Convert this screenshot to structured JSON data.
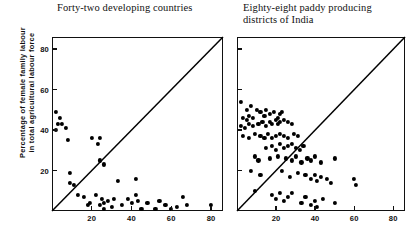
{
  "figure": {
    "ylabel_line1": "Percentage of female family labour",
    "ylabel_line2": "in total agricultural labour force",
    "ink_color": "#000000"
  },
  "chart_data": [
    {
      "type": "scatter",
      "panel": "left",
      "title": "Forty-two developing countries",
      "xlabel": "",
      "ylabel": "Percentage of female family labour in total agricultural labour force",
      "xlim": [
        0,
        86
      ],
      "ylim": [
        0,
        86
      ],
      "xticks": [
        20,
        40,
        60,
        80
      ],
      "yticks": [
        20,
        40,
        60,
        80
      ],
      "grid": false,
      "legend": "none",
      "annotations": [
        "45-degree reference line from origin to top-right corner"
      ],
      "reference_line": {
        "type": "identity",
        "from": [
          0,
          0
        ],
        "to": [
          86,
          86
        ]
      },
      "n_points": 42,
      "points": [
        [
          2,
          49
        ],
        [
          4,
          46
        ],
        [
          3,
          43
        ],
        [
          5,
          43
        ],
        [
          2,
          40
        ],
        [
          7,
          41
        ],
        [
          8,
          35
        ],
        [
          9,
          19
        ],
        [
          9,
          14
        ],
        [
          11,
          13
        ],
        [
          13,
          8
        ],
        [
          16,
          7
        ],
        [
          18,
          3
        ],
        [
          19,
          4
        ],
        [
          20,
          36
        ],
        [
          23,
          33
        ],
        [
          24,
          36
        ],
        [
          24,
          25
        ],
        [
          26,
          23
        ],
        [
          22,
          8
        ],
        [
          24,
          3
        ],
        [
          25,
          6
        ],
        [
          26,
          4
        ],
        [
          26,
          1
        ],
        [
          28,
          5
        ],
        [
          30,
          2
        ],
        [
          31,
          6
        ],
        [
          33,
          15
        ],
        [
          35,
          3
        ],
        [
          38,
          6
        ],
        [
          40,
          4
        ],
        [
          42,
          16
        ],
        [
          42,
          8
        ],
        [
          43,
          5
        ],
        [
          45,
          1
        ],
        [
          48,
          4
        ],
        [
          52,
          1
        ],
        [
          54,
          5
        ],
        [
          57,
          3
        ],
        [
          60,
          1
        ],
        [
          63,
          2
        ],
        [
          66,
          7
        ],
        [
          68,
          3
        ],
        [
          80,
          3
        ]
      ]
    },
    {
      "type": "scatter",
      "panel": "right",
      "title_line1": "Eighty-eight paddy producing",
      "title_line2": "districts of India",
      "title": "Eighty-eight paddy producing districts of India",
      "xlabel": "",
      "ylabel": "Percentage of female family labour in total agricultural labour force",
      "xlim": [
        0,
        86
      ],
      "ylim": [
        0,
        86
      ],
      "xticks": [
        20,
        40,
        60,
        80
      ],
      "yticks": [
        20,
        40,
        60,
        80
      ],
      "grid": false,
      "legend": "none",
      "annotations": [
        "45-degree reference line from origin to top-right corner"
      ],
      "reference_line": {
        "type": "identity",
        "from": [
          0,
          0
        ],
        "to": [
          86,
          86
        ]
      },
      "n_points": 88,
      "points": [
        [
          2,
          54
        ],
        [
          5,
          50
        ],
        [
          7,
          52
        ],
        [
          3,
          46
        ],
        [
          5,
          45
        ],
        [
          6,
          47
        ],
        [
          8,
          46
        ],
        [
          10,
          50
        ],
        [
          12,
          49
        ],
        [
          14,
          47
        ],
        [
          15,
          50
        ],
        [
          17,
          48
        ],
        [
          19,
          49
        ],
        [
          21,
          46
        ],
        [
          22,
          48
        ],
        [
          23,
          49
        ],
        [
          2,
          42
        ],
        [
          4,
          41
        ],
        [
          6,
          43
        ],
        [
          8,
          42
        ],
        [
          11,
          43
        ],
        [
          13,
          44
        ],
        [
          15,
          42
        ],
        [
          17,
          44
        ],
        [
          18,
          43
        ],
        [
          20,
          45
        ],
        [
          21,
          43
        ],
        [
          22,
          44
        ],
        [
          24,
          45
        ],
        [
          26,
          44
        ],
        [
          28,
          43
        ],
        [
          3,
          37
        ],
        [
          6,
          36
        ],
        [
          9,
          38
        ],
        [
          12,
          37
        ],
        [
          14,
          36
        ],
        [
          16,
          38
        ],
        [
          18,
          36
        ],
        [
          20,
          37
        ],
        [
          22,
          38
        ],
        [
          24,
          37
        ],
        [
          26,
          36
        ],
        [
          29,
          38
        ],
        [
          31,
          37
        ],
        [
          15,
          31
        ],
        [
          18,
          32
        ],
        [
          20,
          30
        ],
        [
          22,
          33
        ],
        [
          24,
          31
        ],
        [
          26,
          32
        ],
        [
          28,
          33
        ],
        [
          30,
          31
        ],
        [
          32,
          30
        ],
        [
          34,
          32
        ],
        [
          9,
          27
        ],
        [
          11,
          25
        ],
        [
          17,
          26
        ],
        [
          21,
          27
        ],
        [
          25,
          26
        ],
        [
          28,
          25
        ],
        [
          30,
          27
        ],
        [
          33,
          24
        ],
        [
          36,
          26
        ],
        [
          38,
          25
        ],
        [
          40,
          27
        ],
        [
          43,
          24
        ],
        [
          50,
          26
        ],
        [
          7,
          20
        ],
        [
          12,
          18
        ],
        [
          23,
          20
        ],
        [
          27,
          17
        ],
        [
          31,
          19
        ],
        [
          35,
          18
        ],
        [
          38,
          16
        ],
        [
          40,
          18
        ],
        [
          41,
          15
        ],
        [
          43,
          17
        ],
        [
          46,
          16
        ],
        [
          48,
          14
        ],
        [
          60,
          16
        ],
        [
          61,
          13
        ],
        [
          9,
          10
        ],
        [
          18,
          8
        ],
        [
          20,
          6
        ],
        [
          22,
          9
        ],
        [
          24,
          5
        ],
        [
          26,
          7
        ],
        [
          28,
          9
        ],
        [
          33,
          4
        ],
        [
          35,
          7
        ],
        [
          38,
          3
        ],
        [
          40,
          5
        ],
        [
          41,
          2
        ],
        [
          44,
          6
        ],
        [
          50,
          4
        ]
      ]
    }
  ]
}
